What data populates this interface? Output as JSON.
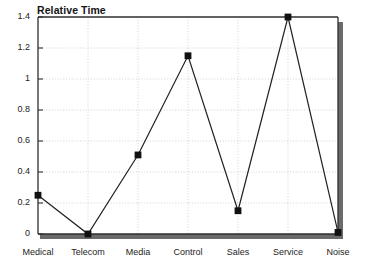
{
  "chart_data": {
    "type": "line",
    "title": "Relative Time",
    "xlabel": "",
    "ylabel": "",
    "categories": [
      "Medical",
      "Telecom",
      "Media",
      "Control",
      "Sales",
      "Service",
      "Noise"
    ],
    "values": [
      0.25,
      0.0,
      0.51,
      1.15,
      0.15,
      1.4,
      0.01
    ],
    "series": [
      {
        "name": "Relative Time",
        "values": [
          0.25,
          0.0,
          0.51,
          1.15,
          0.15,
          1.4,
          0.01
        ]
      }
    ],
    "ylim": [
      0,
      1.4
    ],
    "yticks": [
      0,
      0.2,
      0.4,
      0.6,
      0.8,
      1,
      1.2,
      1.4
    ],
    "ytick_labels": [
      "0",
      "0.2",
      "0.4",
      "0.6",
      "0.8",
      "1",
      "1.2",
      "1.4"
    ],
    "grid": true,
    "grid_style": "dotted",
    "legend": false,
    "legend_position": "none",
    "marker": "filled-square",
    "line_color": "#222222",
    "marker_color": "#111111",
    "grid_color": "#c8c8c8",
    "frame_color": "#333333",
    "shadow_color": "#666666",
    "background": "#ffffff"
  }
}
